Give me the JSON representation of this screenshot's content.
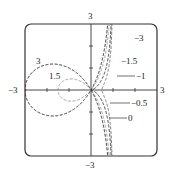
{
  "chart_data": {
    "type": "line",
    "title": "",
    "equation": "y^2 (1 - x) = x^2 (x + c)",
    "xlabel": "",
    "ylabel": "",
    "xlim": [
      -3,
      3
    ],
    "ylim": [
      -3,
      3
    ],
    "grid": false,
    "x_tick_labels": [
      "-3",
      "3"
    ],
    "y_tick_labels": [
      "3",
      "-3"
    ],
    "x_ticks": [
      -2,
      -1,
      1,
      2
    ],
    "y_ticks": [
      -2,
      -1,
      1,
      2
    ],
    "series": [
      {
        "name": "3",
        "c": 3,
        "style": "dashed",
        "color": "#222222",
        "label_pos": "upper-left"
      },
      {
        "name": "1.5",
        "c": 1.5,
        "style": "dashed",
        "color": "#999999",
        "label_pos": "upper-left"
      },
      {
        "name": "0",
        "c": 0,
        "style": "dashed",
        "color": "#333333",
        "label_pos": "lower-right"
      },
      {
        "name": "-0.5",
        "c": -0.5,
        "style": "dashed",
        "color": "#777777",
        "label_pos": "lower-right"
      },
      {
        "name": "-1",
        "c": -1,
        "style": "dotted",
        "color": "#555555",
        "label_pos": "right"
      },
      {
        "name": "-1.5",
        "c": -1.5,
        "style": "solid",
        "color": "#999999",
        "label_pos": "upper-right"
      },
      {
        "name": "-3",
        "c": -3,
        "style": "solid",
        "color": "#111111",
        "label_pos": "upper-right"
      }
    ],
    "curve_labels": [
      "3",
      "1.5",
      "−3",
      "−1.5",
      "−1",
      "−0.5",
      "0"
    ]
  },
  "axis_labels": {
    "top": "3",
    "bottom": "−3",
    "left": "−3",
    "right": "3"
  }
}
